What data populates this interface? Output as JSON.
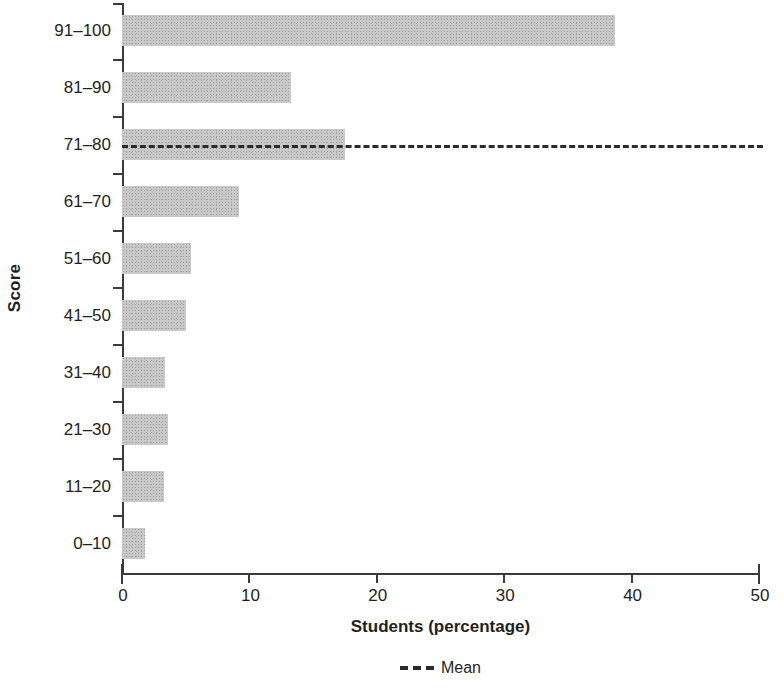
{
  "chart_data": {
    "type": "bar",
    "orientation": "horizontal",
    "title": "",
    "xlabel": "Students (percentage)",
    "ylabel": "Score",
    "categories": [
      "0–10",
      "11–20",
      "21–30",
      "31–40",
      "41–50",
      "51–60",
      "61–70",
      "71–80",
      "81–90",
      "91–100"
    ],
    "values": [
      1.8,
      3.3,
      3.6,
      3.4,
      5.0,
      5.4,
      9.2,
      17.5,
      13.3,
      38.7
    ],
    "series": [
      {
        "name": "Students (percentage)",
        "values": [
          1.8,
          3.3,
          3.6,
          3.4,
          5.0,
          5.4,
          9.2,
          17.5,
          13.3,
          38.7
        ]
      }
    ],
    "xlim": [
      0,
      50
    ],
    "xticks": [
      0,
      10,
      20,
      30,
      40,
      50
    ],
    "xtick_labels": [
      "0",
      "10",
      "20",
      "30",
      "40",
      "50"
    ],
    "grid": false,
    "bar_color": "#c9c9c9",
    "axis_color": "#3b3b3b",
    "annotations": [
      {
        "name": "mean-line",
        "type": "horizontal-reference-line",
        "label": "Mean",
        "at_category": "71–80",
        "style": "dashed",
        "color": "#2b2b2b"
      }
    ],
    "legend": {
      "position": "bottom-center",
      "entries": [
        {
          "label": "Mean",
          "marker": "dashed-line",
          "color": "#2b2b2b"
        }
      ]
    }
  },
  "axes": {
    "y_title": "Score",
    "x_title": "Students (percentage)",
    "x_tick_labels": [
      "0",
      "10",
      "20",
      "30",
      "40",
      "50"
    ],
    "y_tick_labels": [
      "91–100",
      "81–90",
      "71–80",
      "61–70",
      "51–60",
      "41–50",
      "31–40",
      "21–30",
      "11–20",
      "0–10"
    ]
  },
  "rows": [
    {
      "label": "91–100",
      "value": 38.7
    },
    {
      "label": "81–90",
      "value": 13.3
    },
    {
      "label": "71–80",
      "value": 17.5
    },
    {
      "label": "61–70",
      "value": 9.2
    },
    {
      "label": "51–60",
      "value": 5.4
    },
    {
      "label": "41–50",
      "value": 5.0
    },
    {
      "label": "31–40",
      "value": 3.4
    },
    {
      "label": "21–30",
      "value": 3.6
    },
    {
      "label": "11–20",
      "value": 3.3
    },
    {
      "label": "0–10",
      "value": 1.8
    }
  ],
  "legend": {
    "mean_label": "Mean"
  }
}
